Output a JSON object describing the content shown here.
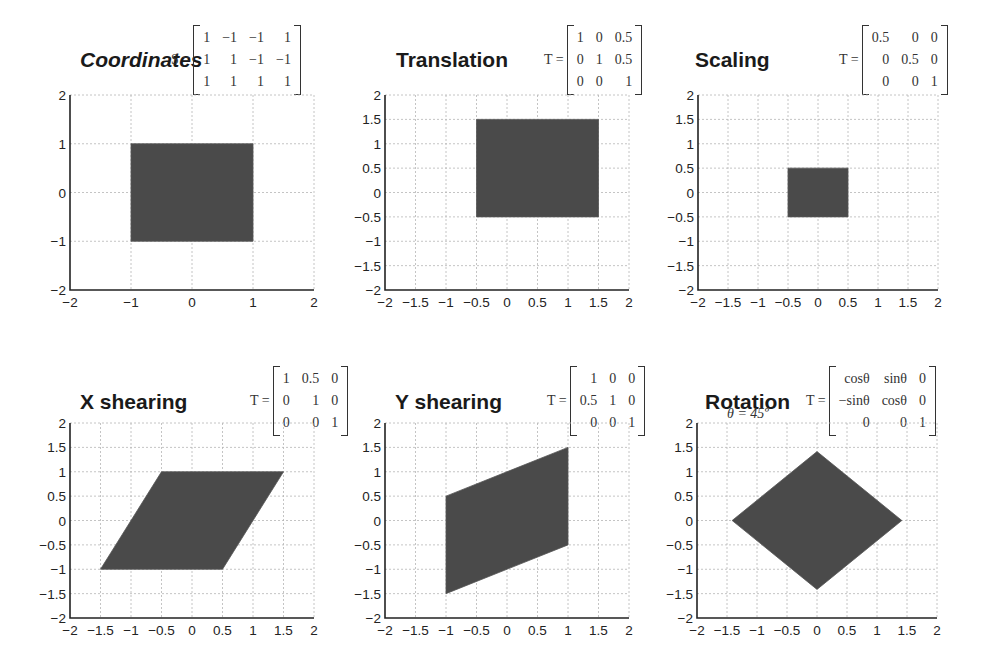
{
  "figure": {
    "panels": [
      {
        "id": "coordinates",
        "title": "Coordinates",
        "italic": true,
        "matrix_label": "S =",
        "matrix": [
          [
            "1",
            "−1",
            "−1",
            "1"
          ],
          [
            "1",
            "1",
            "−1",
            "−1"
          ],
          [
            "1",
            "1",
            "1",
            "1"
          ]
        ],
        "note": "",
        "box": {
          "left": 70,
          "top": 95,
          "right": 314,
          "bottom": 290
        },
        "title_pos": {
          "x": 80,
          "y": 48
        },
        "matrix_pos": {
          "x": 171,
          "y": 25
        },
        "xticks": [
          -2,
          -1,
          0,
          1,
          2
        ],
        "yticks": [
          -2,
          -1,
          0,
          1,
          2
        ],
        "polygon": [
          [
            -1,
            -1
          ],
          [
            1,
            -1
          ],
          [
            1,
            1
          ],
          [
            -1,
            1
          ]
        ]
      },
      {
        "id": "translation",
        "title": "Translation",
        "italic": false,
        "matrix_label": "T =",
        "matrix": [
          [
            "1",
            "0",
            "0.5"
          ],
          [
            "0",
            "1",
            "0.5"
          ],
          [
            "0",
            "0",
            "1"
          ]
        ],
        "note": "",
        "box": {
          "left": 385,
          "top": 95,
          "right": 629,
          "bottom": 290
        },
        "title_pos": {
          "x": 396,
          "y": 48
        },
        "matrix_pos": {
          "x": 544,
          "y": 25
        },
        "xticks": [
          -2,
          -1.5,
          -1,
          -0.5,
          0,
          0.5,
          1,
          1.5,
          2
        ],
        "yticks": [
          -2,
          -1.5,
          -1,
          -0.5,
          0,
          0.5,
          1,
          1.5,
          2
        ],
        "polygon": [
          [
            -0.5,
            -0.5
          ],
          [
            1.5,
            -0.5
          ],
          [
            1.5,
            1.5
          ],
          [
            -0.5,
            1.5
          ]
        ]
      },
      {
        "id": "scaling",
        "title": "Scaling",
        "italic": false,
        "matrix_label": "T =",
        "matrix": [
          [
            "0.5",
            "0",
            "0"
          ],
          [
            "0",
            "0.5",
            "0"
          ],
          [
            "0",
            "0",
            "1"
          ]
        ],
        "note": "",
        "box": {
          "left": 698,
          "top": 95,
          "right": 938,
          "bottom": 290
        },
        "title_pos": {
          "x": 695,
          "y": 48
        },
        "matrix_pos": {
          "x": 839,
          "y": 25
        },
        "xticks": [
          -2,
          -1.5,
          -1,
          -0.5,
          0,
          0.5,
          1,
          1.5,
          2
        ],
        "yticks": [
          -2,
          -1.5,
          -1,
          -0.5,
          0,
          0.5,
          1,
          1.5,
          2
        ],
        "polygon": [
          [
            -0.5,
            -0.5
          ],
          [
            0.5,
            -0.5
          ],
          [
            0.5,
            0.5
          ],
          [
            -0.5,
            0.5
          ]
        ]
      },
      {
        "id": "x-shearing",
        "title": "X shearing",
        "italic": false,
        "matrix_label": "T =",
        "matrix": [
          [
            "1",
            "0.5",
            "0"
          ],
          [
            "0",
            "1",
            "0"
          ],
          [
            "0",
            "0",
            "1"
          ]
        ],
        "note": "",
        "box": {
          "left": 70,
          "top": 423,
          "right": 314,
          "bottom": 618
        },
        "title_pos": {
          "x": 80,
          "y": 390
        },
        "matrix_pos": {
          "x": 250,
          "y": 366
        },
        "xticks": [
          -2,
          -1.5,
          -1,
          -0.5,
          0,
          0.5,
          1,
          1.5,
          2
        ],
        "yticks": [
          -2,
          -1.5,
          -1,
          -0.5,
          0,
          0.5,
          1,
          1.5,
          2
        ],
        "polygon": [
          [
            -1.5,
            -1
          ],
          [
            0.5,
            -1
          ],
          [
            1.5,
            1
          ],
          [
            -0.5,
            1
          ]
        ]
      },
      {
        "id": "y-shearing",
        "title": "Y shearing",
        "italic": false,
        "matrix_label": "T =",
        "matrix": [
          [
            "1",
            "0",
            "0"
          ],
          [
            "0.5",
            "1",
            "0"
          ],
          [
            "0",
            "0",
            "1"
          ]
        ],
        "note": "",
        "box": {
          "left": 385,
          "top": 423,
          "right": 629,
          "bottom": 618
        },
        "title_pos": {
          "x": 395,
          "y": 390
        },
        "matrix_pos": {
          "x": 547,
          "y": 366
        },
        "xticks": [
          -2,
          -1.5,
          -1,
          -0.5,
          0,
          0.5,
          1,
          1.5,
          2
        ],
        "yticks": [
          -2,
          -1.5,
          -1,
          -0.5,
          0,
          0.5,
          1,
          1.5,
          2
        ],
        "polygon": [
          [
            -1,
            -1.5
          ],
          [
            1,
            -0.5
          ],
          [
            1,
            1.5
          ],
          [
            -1,
            0.5
          ]
        ]
      },
      {
        "id": "rotation",
        "title": "Rotation",
        "italic": false,
        "matrix_label": "T =",
        "matrix": [
          [
            "cosθ",
            "sinθ",
            "0"
          ],
          [
            "−sinθ",
            "cosθ",
            "0"
          ],
          [
            "0",
            "0",
            "1"
          ]
        ],
        "note": "θ = 45º",
        "box": {
          "left": 697,
          "top": 423,
          "right": 937,
          "bottom": 618
        },
        "title_pos": {
          "x": 705,
          "y": 390
        },
        "matrix_pos": {
          "x": 806,
          "y": 366
        },
        "xticks": [
          -2,
          -1.5,
          -1,
          -0.5,
          0,
          0.5,
          1,
          1.5,
          2
        ],
        "yticks": [
          -2,
          -1.5,
          -1,
          -0.5,
          0,
          0.5,
          1,
          1.5,
          2
        ],
        "polygon": [
          [
            0,
            -1.414
          ],
          [
            1.414,
            0
          ],
          [
            0,
            1.414
          ],
          [
            -1.414,
            0
          ]
        ]
      }
    ],
    "colors": {
      "fill": "#4a4a4a",
      "grid": "#b5b5b5",
      "axis": "#222222"
    }
  },
  "chart_data": [
    {
      "type": "scatter",
      "title": "Coordinates",
      "matrix": "S = [[1,-1,-1,1],[1,1,-1,-1],[1,1,1,1]]",
      "xlim": [
        -2,
        2
      ],
      "ylim": [
        -2,
        2
      ],
      "grid": true,
      "shape": [
        [
          -1,
          -1
        ],
        [
          1,
          -1
        ],
        [
          1,
          1
        ],
        [
          -1,
          1
        ]
      ]
    },
    {
      "type": "scatter",
      "title": "Translation",
      "matrix": "T = [[1,0,0.5],[0,1,0.5],[0,0,1]]",
      "xlim": [
        -2,
        2
      ],
      "ylim": [
        -2,
        2
      ],
      "grid": true,
      "shape": [
        [
          -0.5,
          -0.5
        ],
        [
          1.5,
          -0.5
        ],
        [
          1.5,
          1.5
        ],
        [
          -0.5,
          1.5
        ]
      ]
    },
    {
      "type": "scatter",
      "title": "Scaling",
      "matrix": "T = [[0.5,0,0],[0,0.5,0],[0,0,1]]",
      "xlim": [
        -2,
        2
      ],
      "ylim": [
        -2,
        2
      ],
      "grid": true,
      "shape": [
        [
          -0.5,
          -0.5
        ],
        [
          0.5,
          -0.5
        ],
        [
          0.5,
          0.5
        ],
        [
          -0.5,
          0.5
        ]
      ]
    },
    {
      "type": "scatter",
      "title": "X shearing",
      "matrix": "T = [[1,0.5,0],[0,1,0],[0,0,1]]",
      "xlim": [
        -2,
        2
      ],
      "ylim": [
        -2,
        2
      ],
      "grid": true,
      "shape": [
        [
          -1.5,
          -1
        ],
        [
          0.5,
          -1
        ],
        [
          1.5,
          1
        ],
        [
          -0.5,
          1
        ]
      ]
    },
    {
      "type": "scatter",
      "title": "Y shearing",
      "matrix": "T = [[1,0,0],[0.5,1,0],[0,0,1]]",
      "xlim": [
        -2,
        2
      ],
      "ylim": [
        -2,
        2
      ],
      "grid": true,
      "shape": [
        [
          -1,
          -1.5
        ],
        [
          1,
          -0.5
        ],
        [
          1,
          1.5
        ],
        [
          -1,
          0.5
        ]
      ]
    },
    {
      "type": "scatter",
      "title": "Rotation",
      "annotation": "θ = 45º",
      "matrix": "T = [[cosθ,sinθ,0],[-sinθ,cosθ,0],[0,0,1]]",
      "xlim": [
        -2,
        2
      ],
      "ylim": [
        -2,
        2
      ],
      "grid": true,
      "shape": [
        [
          0,
          -1.414
        ],
        [
          1.414,
          0
        ],
        [
          0,
          1.414
        ],
        [
          -1.414,
          0
        ]
      ]
    }
  ]
}
